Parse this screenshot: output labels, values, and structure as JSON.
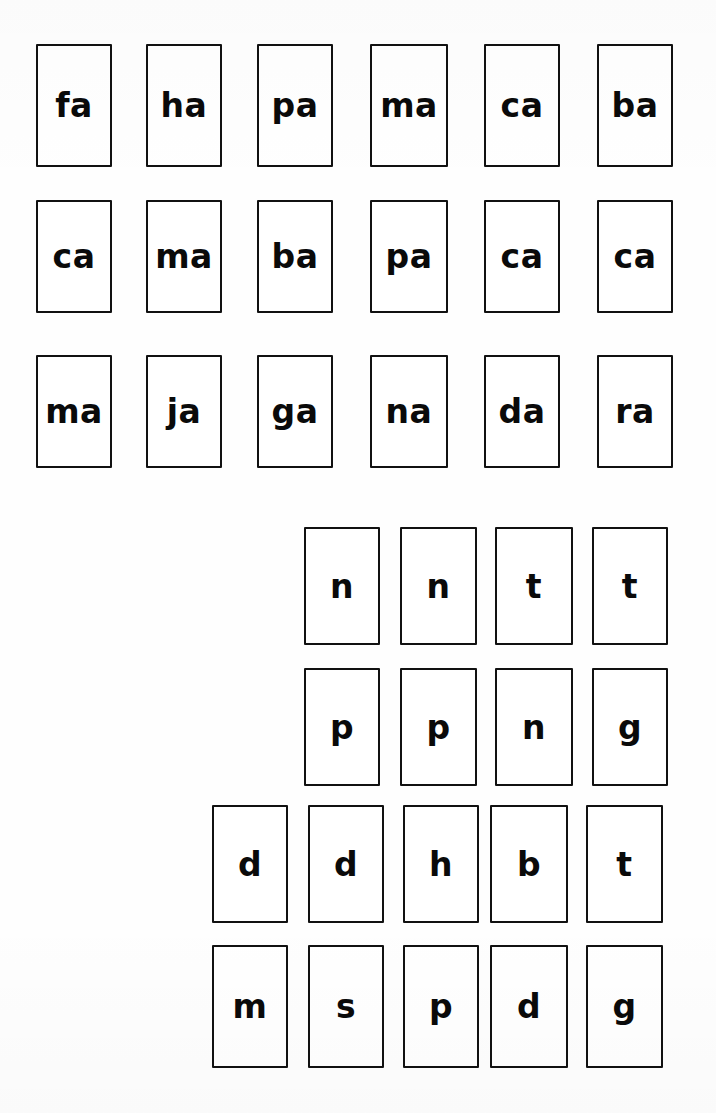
{
  "page": {
    "background_color": "#fefefe",
    "card_border_color": "#111111",
    "text_color": "#0a0a0a",
    "width": 716,
    "height": 1113
  },
  "groups": [
    {
      "name": "syllable-cards",
      "description": "Consonant plus -a syllable cards, three rows of six",
      "rows": [
        {
          "row_index": 1,
          "cards": [
            {
              "label": "fa",
              "x": 36,
              "y": 44,
              "w": 76,
              "h": 123
            },
            {
              "label": "ha",
              "x": 146,
              "y": 44,
              "w": 76,
              "h": 123
            },
            {
              "label": "pa",
              "x": 257,
              "y": 44,
              "w": 76,
              "h": 123
            },
            {
              "label": "ma",
              "x": 370,
              "y": 44,
              "w": 78,
              "h": 123
            },
            {
              "label": "ca",
              "x": 484,
              "y": 44,
              "w": 76,
              "h": 123
            },
            {
              "label": "ba",
              "x": 597,
              "y": 44,
              "w": 76,
              "h": 123
            }
          ]
        },
        {
          "row_index": 2,
          "cards": [
            {
              "label": "ca",
              "x": 36,
              "y": 200,
              "w": 76,
              "h": 113
            },
            {
              "label": "ma",
              "x": 146,
              "y": 200,
              "w": 76,
              "h": 113
            },
            {
              "label": "ba",
              "x": 257,
              "y": 200,
              "w": 76,
              "h": 113
            },
            {
              "label": "pa",
              "x": 370,
              "y": 200,
              "w": 78,
              "h": 113
            },
            {
              "label": "ca",
              "x": 484,
              "y": 200,
              "w": 76,
              "h": 113
            },
            {
              "label": "ca",
              "x": 597,
              "y": 200,
              "w": 76,
              "h": 113
            }
          ]
        },
        {
          "row_index": 3,
          "cards": [
            {
              "label": "ma",
              "x": 36,
              "y": 355,
              "w": 76,
              "h": 113
            },
            {
              "label": "ja",
              "x": 146,
              "y": 355,
              "w": 76,
              "h": 113
            },
            {
              "label": "ga",
              "x": 257,
              "y": 355,
              "w": 76,
              "h": 113
            },
            {
              "label": "na",
              "x": 370,
              "y": 355,
              "w": 78,
              "h": 113
            },
            {
              "label": "da",
              "x": 484,
              "y": 355,
              "w": 76,
              "h": 113
            },
            {
              "label": "ra",
              "x": 597,
              "y": 355,
              "w": 76,
              "h": 113
            }
          ]
        }
      ]
    },
    {
      "name": "single-letter-cards",
      "description": "Single consonant letter cards, four staggered rows on the right side",
      "rows": [
        {
          "row_index": 4,
          "cards": [
            {
              "label": "n",
              "x": 304,
              "y": 527,
              "w": 76,
              "h": 118
            },
            {
              "label": "n",
              "x": 400,
              "y": 527,
              "w": 77,
              "h": 118
            },
            {
              "label": "t",
              "x": 495,
              "y": 527,
              "w": 78,
              "h": 118
            },
            {
              "label": "t",
              "x": 592,
              "y": 527,
              "w": 76,
              "h": 118
            }
          ]
        },
        {
          "row_index": 5,
          "cards": [
            {
              "label": "p",
              "x": 304,
              "y": 668,
              "w": 76,
              "h": 118
            },
            {
              "label": "p",
              "x": 400,
              "y": 668,
              "w": 77,
              "h": 118
            },
            {
              "label": "n",
              "x": 495,
              "y": 668,
              "w": 78,
              "h": 118
            },
            {
              "label": "g",
              "x": 592,
              "y": 668,
              "w": 76,
              "h": 118
            }
          ]
        },
        {
          "row_index": 6,
          "cards": [
            {
              "label": "d",
              "x": 212,
              "y": 805,
              "w": 76,
              "h": 118
            },
            {
              "label": "d",
              "x": 308,
              "y": 805,
              "w": 76,
              "h": 118
            },
            {
              "label": "h",
              "x": 403,
              "y": 805,
              "w": 76,
              "h": 118
            },
            {
              "label": "b",
              "x": 490,
              "y": 805,
              "w": 78,
              "h": 118
            },
            {
              "label": "t",
              "x": 586,
              "y": 805,
              "w": 77,
              "h": 118
            }
          ]
        },
        {
          "row_index": 7,
          "cards": [
            {
              "label": "m",
              "x": 212,
              "y": 945,
              "w": 76,
              "h": 123
            },
            {
              "label": "s",
              "x": 308,
              "y": 945,
              "w": 76,
              "h": 123
            },
            {
              "label": "p",
              "x": 403,
              "y": 945,
              "w": 76,
              "h": 123
            },
            {
              "label": "d",
              "x": 490,
              "y": 945,
              "w": 78,
              "h": 123
            },
            {
              "label": "g",
              "x": 586,
              "y": 945,
              "w": 77,
              "h": 123
            }
          ]
        }
      ]
    }
  ]
}
